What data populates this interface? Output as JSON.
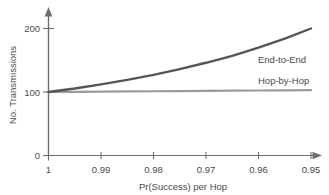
{
  "chart_data": {
    "type": "line",
    "title": "",
    "xlabel": "Pr(Success) per Hop",
    "ylabel": "No. Transmissions",
    "x": [
      1,
      0.99,
      0.98,
      0.97,
      0.96,
      0.95
    ],
    "xticklabels": [
      "1",
      "0.99",
      "0.98",
      "0.97",
      "0.96",
      "0.95"
    ],
    "yticklabels": [
      "0",
      "100",
      "200"
    ],
    "yticks": [
      0,
      100,
      200
    ],
    "ylim": [
      0,
      215
    ],
    "xlim": [
      1,
      0.95
    ],
    "x_axis_direction": "decreasing",
    "grid": false,
    "legend": "inline-right",
    "series": [
      {
        "name": "End-to-End",
        "color": "#555555",
        "values": [
          100,
          112,
          127,
          146,
          170,
          200
        ],
        "dense_x": [
          1,
          0.995,
          0.99,
          0.985,
          0.98,
          0.975,
          0.97,
          0.965,
          0.96,
          0.955,
          0.95
        ],
        "dense_values": [
          100,
          105.5,
          112,
          119,
          127,
          136,
          146,
          157,
          170,
          184,
          200
        ]
      },
      {
        "name": "Hop-by-Hop",
        "color": "#9a9a9a",
        "values": [
          100,
          100.6,
          101.2,
          101.8,
          102.4,
          103
        ],
        "dense_x": [
          1,
          0.995,
          0.99,
          0.985,
          0.98,
          0.975,
          0.97,
          0.965,
          0.96,
          0.955,
          0.95
        ],
        "dense_values": [
          100,
          100.3,
          100.6,
          100.9,
          101.2,
          101.5,
          101.8,
          102.1,
          102.4,
          102.7,
          103
        ]
      }
    ]
  },
  "axes": {
    "y_title": "No. Transmissions",
    "x_title": "Pr(Success) per Hop",
    "y_tick_0": "0",
    "y_tick_100": "100",
    "y_tick_200": "200",
    "x_tick_0": "1",
    "x_tick_1": "0.99",
    "x_tick_2": "0.98",
    "x_tick_3": "0.97",
    "x_tick_4": "0.96",
    "x_tick_5": "0.95"
  },
  "labels": {
    "end_to_end": "End-to-End",
    "hop_by_hop": "Hop-by-Hop"
  },
  "colors": {
    "end_to_end_line": "#555555",
    "hop_by_hop_line": "#9a9a9a",
    "axis": "#6e6e6e",
    "text": "#4a4a4a",
    "background": "#ffffff"
  }
}
